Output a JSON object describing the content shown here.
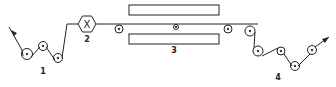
{
  "diagram": {
    "type": "process-schematic",
    "colors": {
      "stroke": "#222222",
      "background": "#ffffff"
    },
    "labels": {
      "section1": "1",
      "section2": "2",
      "section3": "3",
      "section4": "4"
    },
    "hex_symbol": "X",
    "icons": {
      "input-arrow": "arrow",
      "output-arrow": "arrow",
      "roller": "circle-with-center-dot"
    }
  }
}
